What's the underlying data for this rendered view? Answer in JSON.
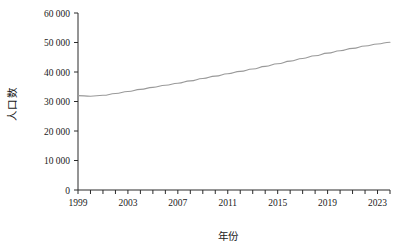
{
  "chart_data": {
    "type": "line",
    "title": "",
    "xlabel": "年份",
    "ylabel": "人口数",
    "xlim": [
      1999,
      2024
    ],
    "ylim": [
      0,
      60000
    ],
    "grid": false,
    "legend": null,
    "line_color": "#9a9a9a",
    "axis_color": "#2b2b2b",
    "x_tick_labels": [
      "1999",
      "2003",
      "2007",
      "2011",
      "2015",
      "2019",
      "2023"
    ],
    "x_tick_values": [
      1999,
      2003,
      2007,
      2011,
      2015,
      2019,
      2023
    ],
    "x_minor_tick_values": [
      1999,
      2000,
      2001,
      2002,
      2003,
      2004,
      2005,
      2006,
      2007,
      2008,
      2009,
      2010,
      2011,
      2012,
      2013,
      2014,
      2015,
      2016,
      2017,
      2018,
      2019,
      2020,
      2021,
      2022,
      2023,
      2024
    ],
    "y_tick_labels": [
      "0",
      "10 000",
      "20 000",
      "30 000",
      "40 000",
      "50 000",
      "60 000"
    ],
    "y_tick_values": [
      0,
      10000,
      20000,
      30000,
      40000,
      50000,
      60000
    ],
    "x": [
      1999,
      2000,
      2001,
      2002,
      2003,
      2004,
      2005,
      2006,
      2007,
      2008,
      2009,
      2010,
      2011,
      2012,
      2013,
      2014,
      2015,
      2016,
      2017,
      2018,
      2019,
      2020,
      2021,
      2022,
      2023,
      2024
    ],
    "values": [
      32000,
      31800,
      32100,
      32700,
      33400,
      34100,
      34800,
      35500,
      36200,
      37000,
      37800,
      38600,
      39400,
      40200,
      41000,
      41900,
      42800,
      43700,
      44600,
      45500,
      46400,
      47200,
      48000,
      48800,
      49500,
      50100
    ],
    "series": [
      {
        "name": "人口数",
        "values": [
          32000,
          31800,
          32100,
          32700,
          33400,
          34100,
          34800,
          35500,
          36200,
          37000,
          37800,
          38600,
          39400,
          40200,
          41000,
          41900,
          42800,
          43700,
          44600,
          45500,
          46400,
          47200,
          48000,
          48800,
          49500,
          50100
        ]
      }
    ]
  }
}
